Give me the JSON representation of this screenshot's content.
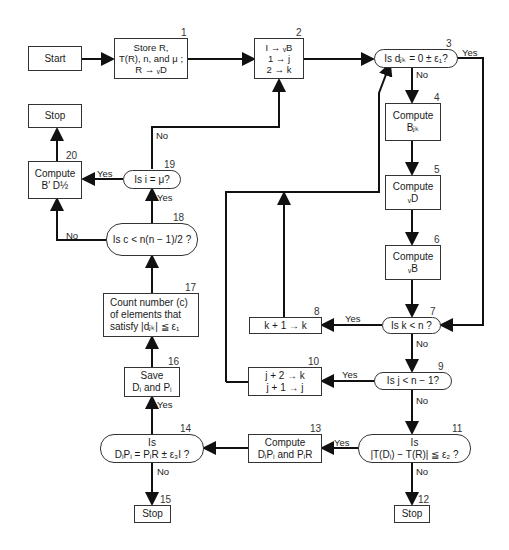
{
  "nodes": {
    "start": {
      "text": "Start"
    },
    "n1": {
      "num": "1",
      "line1": "Store R,",
      "line2": "T(R), n, and μ ;",
      "line3": "R → ᵥD"
    },
    "n2": {
      "num": "2",
      "line1": "I → ᵥB",
      "line2": "1 → j",
      "line3": "2 → k"
    },
    "n3": {
      "num": "3",
      "text": "Is dⱼₖ = 0 ± ε₁?"
    },
    "n4": {
      "num": "4",
      "line1": "Compute",
      "line2": "Bⱼₖ"
    },
    "n5": {
      "num": "5",
      "line1": "Compute",
      "line2": "ᵥD"
    },
    "n6": {
      "num": "6",
      "line1": "Compute",
      "line2": "ᵥB"
    },
    "n7": {
      "num": "7",
      "text": "Is k < n ?"
    },
    "n8": {
      "num": "8",
      "text": "k + 1 → k"
    },
    "n9": {
      "num": "9",
      "text": "Is j < n − 1?"
    },
    "n10": {
      "num": "10",
      "line1": "j + 2 → k",
      "line2": "j + 1 → j"
    },
    "n11": {
      "num": "11",
      "line1": "Is",
      "line2": "|T(Dᵢ) − T(R)| ≦ ε₂ ?"
    },
    "n12": {
      "num": "12",
      "text": "Stop"
    },
    "n13": {
      "num": "13",
      "line1": "Compute",
      "line2": "DᵢPᵢ and PᵢR"
    },
    "n14": {
      "num": "14",
      "line1": "Is",
      "line2": "DᵢPᵢ = PᵢR ± ε₃I ?"
    },
    "n15": {
      "num": "15",
      "text": "Stop"
    },
    "n16": {
      "num": "16",
      "line1": "Save",
      "line2": "Dᵢ and Pᵢ"
    },
    "n17": {
      "num": "17",
      "line1": "Count number (c)",
      "line2": "of elements that",
      "line3": "satisfy |dⱼₖ| ≦ ε₁"
    },
    "n18": {
      "num": "18",
      "text": "Is c < n(n − 1)/2 ?"
    },
    "n19": {
      "num": "19",
      "text": "Is i = μ?"
    },
    "n20": {
      "num": "20",
      "line1": "Compute",
      "line2": "B′ D½"
    },
    "stop_top": {
      "text": "Stop"
    }
  },
  "edge_labels": {
    "n3_yes": "Yes",
    "n3_no": "No",
    "n7_yes": "Yes",
    "n7_no": "No",
    "n9_yes": "Yes",
    "n9_no": "No",
    "n11_yes": "Yes",
    "n11_no": "No",
    "n14_yes": "Yes",
    "n14_no": "No",
    "n18_yes": "Yes",
    "n18_no": "No",
    "n19_yes": "Yes",
    "n19_no": "No"
  }
}
